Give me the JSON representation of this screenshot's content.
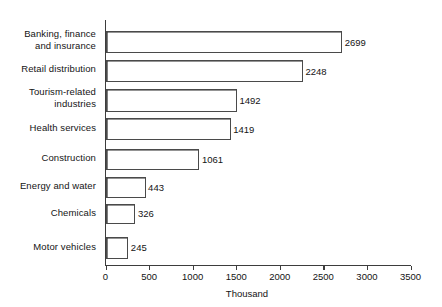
{
  "chart_data": {
    "type": "bar",
    "orientation": "horizontal",
    "title": "",
    "xlabel": "Thousand",
    "ylabel": "",
    "xlim": [
      0,
      3500
    ],
    "xticks": [
      0,
      500,
      1000,
      1500,
      2000,
      2500,
      3000,
      3500
    ],
    "xticklabels": [
      "0",
      "500",
      "1000",
      "1500",
      "2000",
      "2500",
      "3000",
      "3500"
    ],
    "grid": false,
    "legend": null,
    "categories": [
      "Banking, finance\nand insurance",
      "Retail distribution",
      "Tourism-related\nindustries",
      "Health services",
      "Construction",
      "Energy and water",
      "Chemicals",
      "Motor vehicles"
    ],
    "values": [
      2699,
      2248,
      1492,
      1419,
      1061,
      443,
      326,
      245
    ],
    "value_labels": [
      "2699",
      "2248",
      "1492",
      "1419",
      "1061",
      "443",
      "326",
      "245"
    ],
    "bar_face_color": "#ffffff",
    "bar_edge_color": "#3d3d3d",
    "axis_color": "#3d3d3d",
    "background_color": "#ffffff"
  },
  "layout": {
    "bars": [
      {
        "top": 31,
        "height": 22
      },
      {
        "top": 60,
        "height": 22
      },
      {
        "top": 89,
        "height": 23
      },
      {
        "top": 118,
        "height": 22
      },
      {
        "top": 149,
        "height": 21
      },
      {
        "top": 177,
        "height": 21
      },
      {
        "top": 204,
        "height": 20
      },
      {
        "top": 237,
        "height": 22
      }
    ],
    "label_tops": [
      28,
      63,
      86,
      122,
      153,
      181,
      208,
      241
    ]
  }
}
